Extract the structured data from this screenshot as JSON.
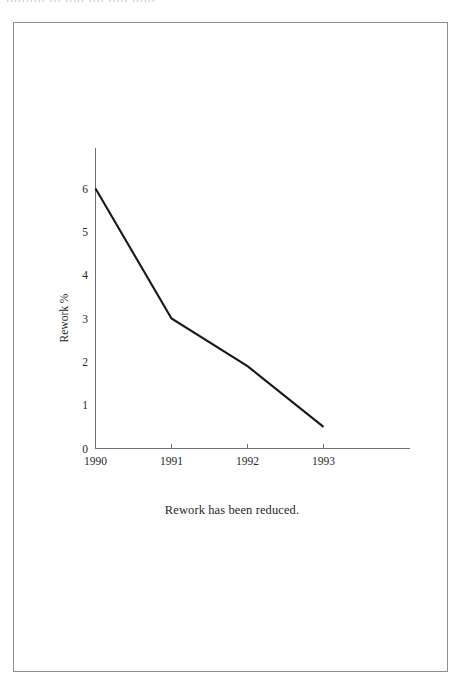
{
  "scan": {
    "header_ghost_text": "ıııııııııı ııı ııııı ıııı ııııı ıııııı"
  },
  "figure": {
    "caption": "Rework has been reduced."
  },
  "chart_data": {
    "type": "line",
    "title": "",
    "subtitle": "",
    "xlabel": "",
    "ylabel": "Rework %",
    "categories": [
      "1990",
      "1991",
      "1992",
      "1993"
    ],
    "x": [
      1990,
      1991,
      1992,
      1993
    ],
    "values": [
      6,
      3,
      1.9,
      0.5
    ],
    "series": [
      {
        "name": "Rework %",
        "values": [
          6,
          3,
          1.9,
          0.5
        ]
      }
    ],
    "xlim": [
      1990,
      1993
    ],
    "ylim": [
      0,
      6
    ],
    "y_ticks": [
      0,
      1,
      2,
      3,
      4,
      5,
      6
    ],
    "y_tick_labels": [
      "0",
      "1",
      "2",
      "3",
      "4",
      "5",
      "6"
    ],
    "x_ticks": [
      1990,
      1991,
      1992,
      1993
    ],
    "x_tick_labels": [
      "1990",
      "1991",
      "1992",
      "1993"
    ],
    "grid": false,
    "legend": false,
    "legend_position": "none",
    "line_color": "#18181a",
    "axis_color": "#6f6f76",
    "background_color": "#ffffff",
    "annotations": []
  },
  "axis_labels": {
    "y": {
      "t6": "6",
      "t5": "5",
      "t4": "4",
      "t3": "3",
      "t2": "2",
      "t1": "1",
      "t0": "0"
    },
    "x": {
      "t1990": "1990",
      "t1991": "1991",
      "t1992": "1992",
      "t1993": "1993"
    },
    "y_title": "Rework %"
  }
}
